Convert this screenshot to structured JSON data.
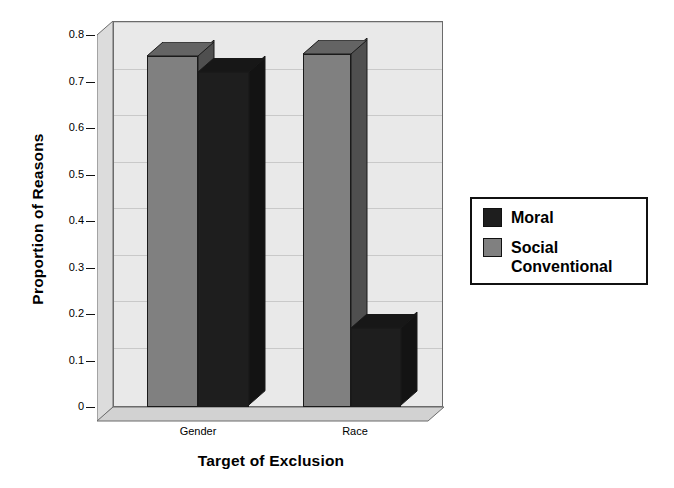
{
  "chart_data": {
    "type": "bar",
    "title": "",
    "xlabel": "Target of Exclusion",
    "ylabel": "Proportion of Reasons",
    "categories": [
      "Gender",
      "Race"
    ],
    "series": [
      {
        "name": "Moral",
        "color": "#1e1e1e",
        "values": [
          0.72,
          0.17
        ]
      },
      {
        "name": "Social Conventional",
        "color": "#808080",
        "values": [
          0.755,
          0.76
        ]
      }
    ],
    "ylim": [
      0,
      0.8
    ],
    "yticks": [
      {
        "value": 0.8,
        "label": "0.8"
      },
      {
        "value": 0.7,
        "label": "0.7"
      },
      {
        "value": 0.6,
        "label": "0.6"
      },
      {
        "value": 0.5,
        "label": "0.5"
      },
      {
        "value": 0.4,
        "label": "0.4"
      },
      {
        "value": 0.3,
        "label": "0.3"
      },
      {
        "value": 0.2,
        "label": "0.2"
      },
      {
        "value": 0.1,
        "label": "0.1"
      },
      {
        "value": 0.0,
        "label": "0"
      }
    ],
    "grid": true,
    "legend_position": "right",
    "style": "3d-column",
    "plot_background": "#e9e9e9",
    "wall_color": "#dcdcdc",
    "floor_color": "#d2d2d2",
    "gridline_color": "#c9c9c9",
    "axis_color": "#111111"
  },
  "legend": {
    "entries": [
      {
        "label": "Moral",
        "color": "#1e1e1e"
      },
      {
        "label": "Social\nConventional",
        "color": "#808080"
      }
    ]
  }
}
